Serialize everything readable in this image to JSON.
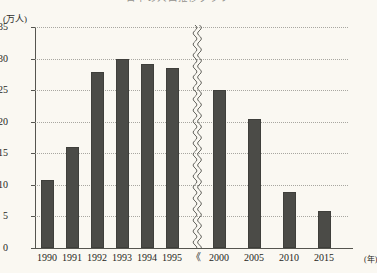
{
  "chart_data": {
    "type": "bar",
    "title": "日本の人口推移グラフ",
    "xlabel": "(年)",
    "ylabel": "(万人)",
    "categories": [
      "1990",
      "1991",
      "1992",
      "1993",
      "1994",
      "1995",
      "2000",
      "2005",
      "2010",
      "2015"
    ],
    "values": [
      10.8,
      16.0,
      27.8,
      30.0,
      29.2,
      28.5,
      25.0,
      20.5,
      8.8,
      5.8
    ],
    "ylim": [
      0,
      35
    ],
    "yticks": [
      0,
      5,
      10,
      15,
      20,
      25,
      30,
      35
    ],
    "ytick_labels": [
      "0",
      "5",
      "10",
      "15",
      "20",
      "25",
      "30",
      "35"
    ],
    "grid": true,
    "legend": "none",
    "axis_break": {
      "present": true,
      "between": [
        "1995",
        "2000"
      ],
      "label": "《"
    },
    "bar_color": "#4b4b47",
    "background_color": "#faf8f2",
    "grid_color": "#9a9a93",
    "axis_color": "#55554f"
  },
  "units": {
    "y": "(万人)",
    "x": "(年)"
  }
}
